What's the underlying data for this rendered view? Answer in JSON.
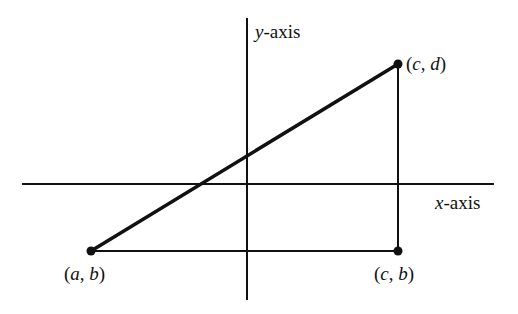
{
  "diagram": {
    "type": "coordinate-plane-right-triangle",
    "colors": {
      "background": "#ffffff",
      "ink": "#111111"
    },
    "axes": {
      "x_axis": {
        "var": "x",
        "suffix": "-axis",
        "label": "x-axis",
        "from": [
          22,
          184
        ],
        "to": [
          494,
          184
        ]
      },
      "y_axis": {
        "var": "y",
        "suffix": "-axis",
        "label": "y-axis",
        "from": [
          247,
          18
        ],
        "to": [
          247,
          300
        ]
      }
    },
    "points": [
      {
        "id": "ab",
        "label": "(a, b)",
        "open": "(",
        "v1": "a",
        "sep": ", ",
        "v2": "b",
        "close": ")",
        "x": 91,
        "y": 251
      },
      {
        "id": "cd",
        "label": "(c, d)",
        "open": "(",
        "v1": "c",
        "sep": ", ",
        "v2": "d",
        "close": ")",
        "x": 398,
        "y": 64
      },
      {
        "id": "cb",
        "label": "(c, b)",
        "open": "(",
        "v1": "c",
        "sep": ", ",
        "v2": "b",
        "close": ")",
        "x": 398,
        "y": 251
      }
    ],
    "segments": [
      {
        "id": "hypotenuse",
        "from": "ab",
        "to": "cd",
        "weight": "thick"
      },
      {
        "id": "horizontal-leg",
        "from": "ab",
        "to": "cb",
        "weight": "thin"
      },
      {
        "id": "vertical-leg",
        "from": "cb",
        "to": "cd",
        "weight": "thin"
      }
    ]
  }
}
